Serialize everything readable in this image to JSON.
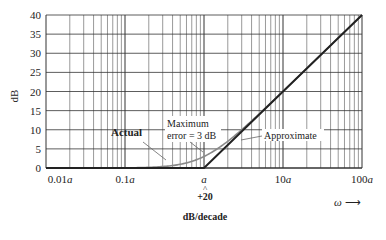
{
  "chart_data": {
    "type": "line",
    "title": "",
    "xlabel": "ω →",
    "ylabel": "dB",
    "x_scale": "log",
    "xlim": [
      "0.01a",
      "100a"
    ],
    "ylim": [
      0,
      40
    ],
    "grid": true,
    "x_ticks": [
      "0.01a",
      "0.1a",
      "a",
      "10a",
      "100a"
    ],
    "y_ticks": [
      0,
      5,
      10,
      15,
      20,
      25,
      30,
      35,
      40
    ],
    "series": [
      {
        "name": "Approximate",
        "x": [
          0.01,
          1,
          100
        ],
        "y": [
          0,
          0,
          40
        ],
        "color": "#222222"
      },
      {
        "name": "Actual",
        "x": [
          0.01,
          0.1,
          0.3,
          0.5,
          1,
          2,
          3,
          5,
          10,
          100
        ],
        "y": [
          0,
          0.04,
          0.4,
          1.0,
          3.0,
          7.0,
          10.0,
          14.1,
          20.0,
          40.0
        ],
        "color": "#888888"
      }
    ],
    "annotations": [
      "Actual",
      "Maximum error = 3 dB",
      "Approximate",
      "+20 dB/decade"
    ]
  },
  "labels": {
    "ylabel": "dB",
    "xlabel": "ω",
    "actual": "Actual",
    "max_error_1": "Maximum",
    "max_error_2": "error = 3 dB",
    "approximate": "Approximate",
    "slope_1": "+20",
    "slope_2": "dB/decade",
    "x0": "0.01",
    "x1": "0.1",
    "x2": "",
    "x3": "10",
    "x4": "100",
    "a": "a"
  }
}
